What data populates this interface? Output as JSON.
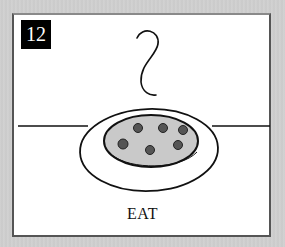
{
  "card": {
    "number": "12",
    "caption": "EAT"
  },
  "illustration": {
    "description": "steam rising above a plate of food on a table",
    "elements": [
      "steam",
      "table-line",
      "plate",
      "food",
      "food-dots"
    ],
    "colors": {
      "panel": "#ffffff",
      "frame": "#cfcfcf",
      "badge": "#000000",
      "food": "#c8c8c8",
      "dots": "#555555",
      "ink": "#111111"
    }
  }
}
